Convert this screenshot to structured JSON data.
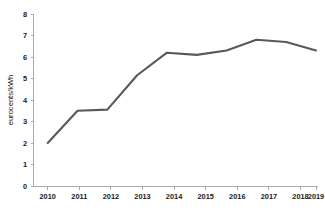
{
  "chart_data": {
    "type": "line",
    "title": "",
    "subtitle": "",
    "xlabel": "",
    "ylabel": "eurocents/kWh",
    "categories": [
      "2010",
      "2011",
      "2012",
      "2013",
      "2014",
      "2015",
      "2016",
      "2017",
      "2018",
      "2019"
    ],
    "values": [
      2.0,
      3.5,
      3.55,
      5.15,
      6.2,
      6.1,
      6.3,
      6.8,
      6.7,
      6.3
    ],
    "series": [
      {
        "name": "eurocents/kWh",
        "values": [
          2.0,
          3.5,
          3.55,
          5.15,
          6.2,
          6.1,
          6.3,
          6.8,
          6.7,
          6.3
        ]
      }
    ],
    "ylim": [
      0,
      8
    ],
    "yticks": [
      "0",
      "1",
      "2",
      "3",
      "4",
      "5",
      "6",
      "7",
      "8"
    ],
    "ytick_values": [
      0,
      1,
      2,
      3,
      4,
      5,
      6,
      7,
      8
    ],
    "xticks": [
      "2010",
      "2011",
      "2012",
      "2013",
      "2014",
      "2015",
      "2016",
      "2017",
      "2018",
      "2019"
    ],
    "grid": false,
    "legend": false,
    "legend_position": "none",
    "markers": false,
    "colors": {
      "line": "#595959",
      "axis": "#aaaaaa",
      "text": "#1a1a1a",
      "background": "#ffffff"
    }
  }
}
